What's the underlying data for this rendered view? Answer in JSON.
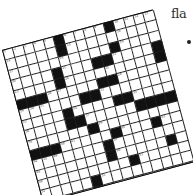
{
  "side_text": "fla",
  "puzzle": {
    "size": 15,
    "rows": [
      ".....#....#....",
      ".....#.........",
      "..........#....",
      "....#...##....#",
      "....#.........#",
      "###.....##.....",
      "......##.......",
      "....#....##....",
      "....##.....####",
      "......#........",
      "###.....#...#..",
      ".......#.......",
      ".......#.....#.",
      ".........#.....",
      ".....#.........",
      "..............."
    ],
    "numbers": [
      {
        "r": 0,
        "c": 0,
        "n": "1"
      },
      {
        "r": 0,
        "c": 1,
        "n": "2"
      },
      {
        "r": 0,
        "c": 2,
        "n": "3"
      },
      {
        "r": 0,
        "c": 3,
        "n": "4"
      },
      {
        "r": 0,
        "c": 4,
        "n": "5"
      },
      {
        "r": 0,
        "c": 6,
        "n": "6"
      },
      {
        "r": 0,
        "c": 7,
        "n": "7"
      },
      {
        "r": 0,
        "c": 8,
        "n": "8"
      },
      {
        "r": 0,
        "c": 9,
        "n": "9"
      },
      {
        "r": 0,
        "c": 11,
        "n": "10"
      },
      {
        "r": 0,
        "c": 12,
        "n": "11"
      },
      {
        "r": 0,
        "c": 13,
        "n": "12"
      },
      {
        "r": 0,
        "c": 14,
        "n": "13"
      },
      {
        "r": 1,
        "c": 0,
        "n": "14"
      },
      {
        "r": 1,
        "c": 6,
        "n": "15"
      },
      {
        "r": 1,
        "c": 11,
        "n": "16"
      },
      {
        "r": 2,
        "c": 0,
        "n": "17"
      },
      {
        "r": 2,
        "c": 5,
        "n": "18"
      },
      {
        "r": 2,
        "c": 11,
        "n": "19"
      },
      {
        "r": 3,
        "c": 0,
        "n": "20"
      },
      {
        "r": 3,
        "c": 5,
        "n": "21"
      },
      {
        "r": 3,
        "c": 10,
        "n": "22"
      },
      {
        "r": 4,
        "c": 0,
        "n": "23"
      },
      {
        "r": 4,
        "c": 5,
        "n": "24"
      },
      {
        "r": 4,
        "c": 9,
        "n": "25"
      },
      {
        "r": 5,
        "c": 3,
        "n": "26"
      },
      {
        "r": 5,
        "c": 4,
        "n": "27"
      },
      {
        "r": 5,
        "c": 10,
        "n": "28"
      },
      {
        "r": 6,
        "c": 0,
        "n": "29"
      },
      {
        "r": 6,
        "c": 1,
        "n": "30"
      },
      {
        "r": 6,
        "c": 2,
        "n": "31"
      },
      {
        "r": 6,
        "c": 8,
        "n": "32"
      },
      {
        "r": 7,
        "c": 0,
        "n": "33"
      },
      {
        "r": 7,
        "c": 5,
        "n": "34"
      },
      {
        "r": 7,
        "c": 11,
        "n": "35"
      },
      {
        "r": 8,
        "c": 0,
        "n": "36"
      },
      {
        "r": 8,
        "c": 6,
        "n": "37"
      },
      {
        "r": 9,
        "c": 0,
        "n": "38"
      },
      {
        "r": 9,
        "c": 7,
        "n": "39"
      },
      {
        "r": 10,
        "c": 3,
        "n": "40"
      },
      {
        "r": 10,
        "c": 4,
        "n": "41"
      },
      {
        "r": 10,
        "c": 9,
        "n": "42"
      },
      {
        "r": 10,
        "c": 13,
        "n": "43"
      },
      {
        "r": 11,
        "c": 0,
        "n": "44"
      },
      {
        "r": 11,
        "c": 1,
        "n": "45"
      },
      {
        "r": 11,
        "c": 2,
        "n": "46"
      },
      {
        "r": 11,
        "c": 8,
        "n": "47"
      },
      {
        "r": 12,
        "c": 0,
        "n": "48"
      },
      {
        "r": 12,
        "c": 8,
        "n": "49"
      },
      {
        "r": 13,
        "c": 0,
        "n": "50"
      },
      {
        "r": 13,
        "c": 10,
        "n": "51"
      },
      {
        "r": 14,
        "c": 0,
        "n": "52"
      },
      {
        "r": 14,
        "c": 6,
        "n": "53"
      }
    ]
  }
}
